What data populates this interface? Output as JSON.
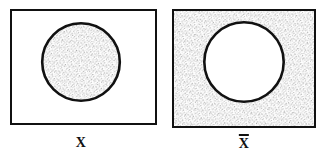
{
  "figure": {
    "type": "venn-diagram",
    "background_color": "#ffffff",
    "ink_color": "#111111",
    "stipple_color": "#6a6a6a"
  },
  "panels": [
    {
      "id": "panel-x",
      "label": "X",
      "has_overbar": false,
      "meaning": "set X",
      "rectangle": {
        "x": 10,
        "y": 9,
        "width": 147,
        "height": 116,
        "stroke_width": 1.6,
        "stroke_color": "#111111",
        "fill": "white",
        "shaded": false
      },
      "circle": {
        "cx": 81,
        "cy": 62,
        "r": 40,
        "stroke_width": 2.6,
        "stroke_color": "#111111",
        "fill": "stipple",
        "shaded": true
      },
      "shaded_region": "inside-circle"
    },
    {
      "id": "panel-x-complement",
      "label": "X",
      "has_overbar": true,
      "meaning": "complement of set X",
      "rectangle": {
        "x": 172,
        "y": 9,
        "width": 144,
        "height": 119,
        "stroke_width": 2.2,
        "stroke_color": "#111111",
        "fill": "stipple",
        "shaded": true
      },
      "circle": {
        "cx": 244,
        "cy": 62,
        "r": 41,
        "stroke_width": 2.6,
        "stroke_color": "#111111",
        "fill": "white",
        "shaded": false
      },
      "shaded_region": "outside-circle-inside-rectangle"
    }
  ],
  "labels": {
    "left": "X",
    "right": "X",
    "right_overbar": true,
    "right_full": "X̄"
  }
}
